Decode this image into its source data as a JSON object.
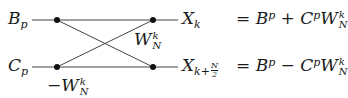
{
  "diagram": {
    "type": "butterfly",
    "title": "",
    "inputs": [
      {
        "id": "Bp",
        "base": "B",
        "sub": "p"
      },
      {
        "id": "Cp",
        "base": "C",
        "sub": "p"
      }
    ],
    "twiddles": {
      "upper": {
        "sign": "",
        "base": "W",
        "sup": "k",
        "sub": "N"
      },
      "lower": {
        "sign": "−",
        "base": "W",
        "sup": "k",
        "sub": "N"
      }
    },
    "outputs": [
      {
        "id": "Xk",
        "base": "X",
        "sub": "k",
        "equation": {
          "lhs": "=",
          "terms": [
            "B",
            "p",
            "+",
            "C",
            "p",
            "W",
            "k",
            "N"
          ]
        }
      },
      {
        "id": "Xk_plus_N2",
        "base": "X",
        "sub_prefix": "k+",
        "sub_frac_num": "N",
        "sub_frac_den": "2",
        "equation": {
          "lhs": "=",
          "terms": [
            "B",
            "p",
            "−",
            "C",
            "p",
            "W",
            "k",
            "N"
          ]
        }
      }
    ],
    "colors": {
      "line": "#444444",
      "node": "#111111",
      "text": "#1a1a1a"
    }
  },
  "labels": {
    "B": "B",
    "p": "p",
    "C": "C",
    "W": "W",
    "k": "k",
    "N": "N",
    "X": "X",
    "minus": "−",
    "plus": "+",
    "eq": "=",
    "kplus": "k+",
    "two": "2"
  }
}
